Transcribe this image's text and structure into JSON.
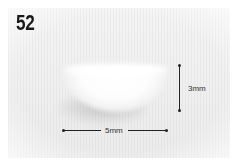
{
  "figure": {
    "number": "52"
  },
  "annotations": {
    "height_label": "3mm",
    "width_label": "5mm"
  },
  "colors": {
    "background": "#ffffff",
    "fabric": "#efefef",
    "line": "#222222",
    "number_text": "#1a1a1a"
  }
}
